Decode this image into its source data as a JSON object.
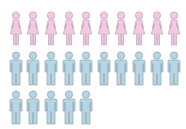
{
  "chart_data": {
    "type": "pictogram",
    "title": "",
    "series": [
      {
        "name": "Women",
        "value": 10,
        "color": "#f6c8e4",
        "stroke": "#b9a7b3",
        "icon": "female-figure-icon"
      },
      {
        "name": "Men",
        "value": 15,
        "color": "#b6d6e6",
        "stroke": "#8ea4ad",
        "icon": "male-figure-icon"
      }
    ],
    "icons_per_row": 10,
    "rows": [
      {
        "series": "Women",
        "count": 10
      },
      {
        "series": "Men",
        "count": 10
      },
      {
        "series": "Men",
        "count": 5
      }
    ]
  }
}
